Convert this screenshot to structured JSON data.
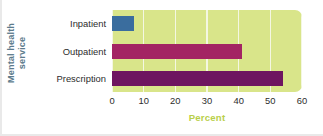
{
  "chart_data": {
    "type": "bar",
    "orientation": "horizontal",
    "title": "",
    "subtitle": "",
    "xlabel": "Percent",
    "ylabel": "Mental health service",
    "ylabel_lines": [
      "Mental health",
      "service"
    ],
    "categories": [
      "Inpatient",
      "Outpatient",
      "Prescription"
    ],
    "values": [
      7,
      41,
      54
    ],
    "xlim": [
      0,
      60
    ],
    "xticks": [
      0,
      10,
      20,
      30,
      40,
      50,
      60
    ],
    "xtick_labels": [
      "0",
      "10",
      "20",
      "30",
      "40",
      "50",
      "60"
    ],
    "grid": "vertical",
    "gridline_color": "#f4f7e2",
    "legend": "none",
    "plot_background": "#d9e58a",
    "bar_colors": [
      "#3a6d9e",
      "#a32463",
      "#6e1560"
    ],
    "xlabel_color": "#b9cf4a",
    "ylabel_color": "#5d7b8c",
    "series": [
      {
        "name": "Percent using service",
        "points": [
          {
            "category": "Inpatient",
            "value": 7,
            "color": "#3a6d9e"
          },
          {
            "category": "Outpatient",
            "value": 41,
            "color": "#a32463"
          },
          {
            "category": "Prescription",
            "value": 54,
            "color": "#6e1560"
          }
        ]
      }
    ]
  }
}
